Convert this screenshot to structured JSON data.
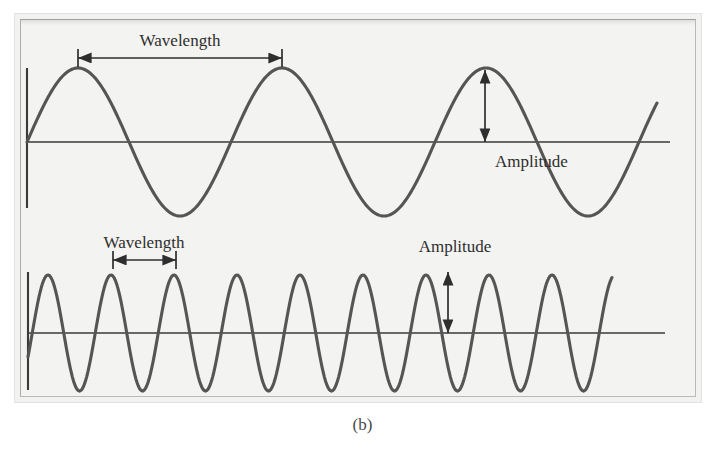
{
  "figure": {
    "caption": "(b)",
    "background_color": "#f3f3f1",
    "page_color": "#ffffff",
    "frame_border_color": "#b9b9b7",
    "curve_color": "#555555",
    "axis_color": "#3a3a3a",
    "text_color": "#2e2e2e"
  },
  "waves": [
    {
      "id": "long-wavelength-wave",
      "name": "top-wave",
      "description": "low frequency large wavelength sine wave",
      "baseline_y": 142,
      "amplitude_px": 74,
      "wavelength_px": 204,
      "peak_count": 3,
      "first_peak_x": 78,
      "start_x": 27,
      "end_x": 657,
      "axis_start_x": 27,
      "axis_end_x": 670,
      "y_axis_top": 68,
      "y_axis_bottom": 208,
      "labels": {
        "wavelength": "Wavelength",
        "amplitude": "Amplitude"
      },
      "wavelength_marker": {
        "x_start": 78,
        "x_end": 282,
        "y": 58,
        "label_x": 180,
        "label_y": 46,
        "tick_half_height": 9
      },
      "amplitude_marker": {
        "x": 485,
        "y_top": 70,
        "y_bottom": 142,
        "label_x": 495,
        "label_y": 167,
        "label_anchor": "start"
      }
    },
    {
      "id": "short-wavelength-wave",
      "name": "bottom-wave",
      "description": "high frequency small wavelength sine wave",
      "baseline_y": 333,
      "amplitude_px": 58,
      "wavelength_px": 63,
      "peak_count": 9,
      "first_peak_x": 48,
      "start_x": 28,
      "end_x": 612,
      "axis_start_x": 28,
      "axis_end_x": 665,
      "y_axis_top": 272,
      "y_axis_bottom": 390,
      "labels": {
        "wavelength": "Wavelength",
        "amplitude": "Amplitude"
      },
      "wavelength_marker": {
        "x_start": 113,
        "x_end": 176,
        "y": 260,
        "label_x": 144,
        "label_y": 248,
        "tick_half_height": 9
      },
      "amplitude_marker": {
        "x": 448,
        "y_top": 272,
        "y_bottom": 333,
        "label_x": 455,
        "label_y": 252,
        "label_anchor": "middle"
      }
    }
  ],
  "chart_data": {
    "type": "line",
    "title": "(b)",
    "xlabel": "",
    "ylabel": "",
    "grid": false,
    "legend": "none",
    "annotations": [
      "Wavelength",
      "Amplitude",
      "Wavelength",
      "Amplitude"
    ],
    "series": [
      {
        "name": "Long wavelength wave",
        "form": "sine",
        "relative_amplitude": 1.0,
        "relative_wavelength": 1.0,
        "cycles_shown": 3,
        "comment": "low frequency, long wavelength, large amplitude"
      },
      {
        "name": "Short wavelength wave",
        "form": "sine",
        "relative_amplitude": 0.78,
        "relative_wavelength": 0.31,
        "cycles_shown": 9,
        "comment": "high frequency, short wavelength, smaller amplitude"
      }
    ]
  }
}
